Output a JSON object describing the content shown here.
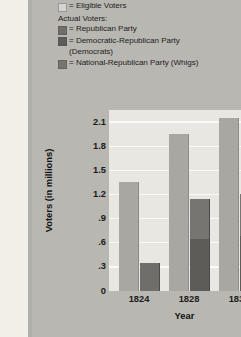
{
  "legend": {
    "eligible": {
      "label": "= Eligible Voters",
      "color": "#d6d4cf"
    },
    "actual_header": "Actual Voters:",
    "items": [
      {
        "label": "= Republican Party",
        "color": "#6f6e6b"
      },
      {
        "label": "= Democratic-Republican Party",
        "continuation": "(Democrats)",
        "color": "#5d5c59"
      },
      {
        "label": "= National-Republican Party (Whigs)",
        "color": "#767572"
      }
    ]
  },
  "chart_data": {
    "type": "bar",
    "title": "",
    "xlabel": "Year",
    "ylabel": "Voters (in millions)",
    "categories": [
      "1824",
      "1828",
      "1832"
    ],
    "ylim": [
      0,
      2.25
    ],
    "yticks": [
      "0",
      ".3",
      ".6",
      ".9",
      "1.2",
      "1.5",
      "1.8",
      "2.1"
    ],
    "ytick_values": [
      0,
      0.3,
      0.6,
      0.9,
      1.2,
      1.5,
      1.8,
      2.1
    ],
    "grid": true,
    "legend_position": "top",
    "series": [
      {
        "name": "Eligible Voters",
        "color": "#a9a7a2",
        "values": [
          1.35,
          1.95,
          2.15
        ]
      },
      {
        "name": "Republican Party",
        "color": "#6f6e6b",
        "values": [
          0.35,
          0,
          0
        ]
      },
      {
        "name": "Democratic-Republican Party (Democrats)",
        "color": "#5d5c59",
        "values": [
          0,
          0.65,
          0.68
        ]
      },
      {
        "name": "National-Republican Party (Whigs)",
        "color": "#767572",
        "values": [
          0,
          0.5,
          0.52
        ]
      }
    ]
  }
}
